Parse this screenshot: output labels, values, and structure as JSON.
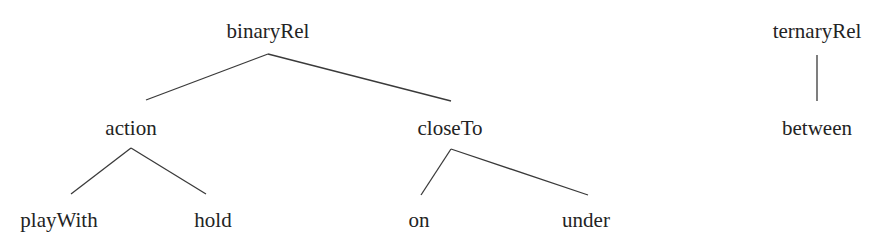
{
  "diagram": {
    "type": "taxonomy-tree",
    "colors": {
      "text": "#232323",
      "edge": "#3a3a3a",
      "background": "#ffffff"
    },
    "nodes": {
      "binaryRel": {
        "label": "binaryRel",
        "x": 268,
        "y": 38
      },
      "action": {
        "label": "action",
        "x": 131,
        "y": 135
      },
      "closeTo": {
        "label": "closeTo",
        "x": 450,
        "y": 135
      },
      "playWith": {
        "label": "playWith",
        "x": 59,
        "y": 227
      },
      "hold": {
        "label": "hold",
        "x": 213,
        "y": 227
      },
      "on": {
        "label": "on",
        "x": 419,
        "y": 227
      },
      "under": {
        "label": "under",
        "x": 586,
        "y": 227
      },
      "ternaryRel": {
        "label": "ternaryRel",
        "x": 817,
        "y": 38
      },
      "between": {
        "label": "between",
        "x": 817,
        "y": 135
      }
    },
    "edges": [
      {
        "from": "binaryRel",
        "to": "action",
        "x1": 268,
        "y1": 54,
        "x2": 146,
        "y2": 100
      },
      {
        "from": "binaryRel",
        "to": "closeTo",
        "x1": 268,
        "y1": 54,
        "x2": 451,
        "y2": 101
      },
      {
        "from": "action",
        "to": "playWith",
        "x1": 131,
        "y1": 148,
        "x2": 71,
        "y2": 194
      },
      {
        "from": "action",
        "to": "hold",
        "x1": 131,
        "y1": 148,
        "x2": 206,
        "y2": 194
      },
      {
        "from": "closeTo",
        "to": "on",
        "x1": 451,
        "y1": 149,
        "x2": 421,
        "y2": 195
      },
      {
        "from": "closeTo",
        "to": "under",
        "x1": 451,
        "y1": 149,
        "x2": 588,
        "y2": 195
      },
      {
        "from": "ternaryRel",
        "to": "between",
        "x1": 817,
        "y1": 55,
        "x2": 817,
        "y2": 101
      }
    ]
  }
}
